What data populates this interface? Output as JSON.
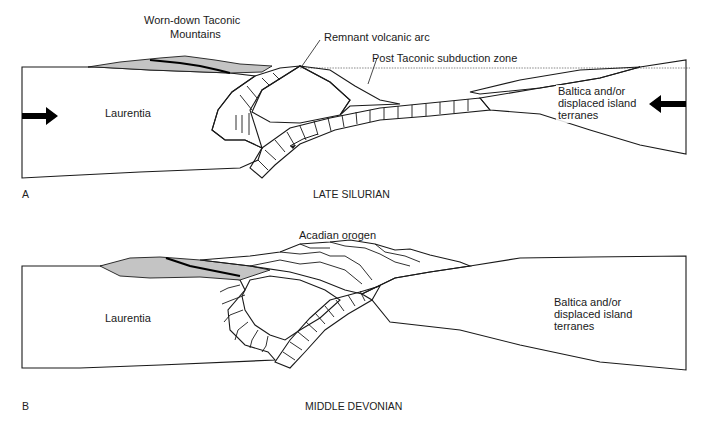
{
  "panels": [
    {
      "letter": "A",
      "caption": "LATE SILURIAN",
      "labels": {
        "mountains_line1": "Worn-down Taconic",
        "mountains_line2": "Mountains",
        "volcanic_arc": "Remnant volcanic arc",
        "subduction_zone": "Post Taconic subduction zone",
        "laurentia": "Laurentia",
        "baltica_line1": "Baltica and/or",
        "baltica_line2": "displaced island",
        "baltica_line3": "terranes"
      },
      "arrows": [
        "convergence-arrow-east",
        "convergence-arrow-west",
        "slab-motion-arrow"
      ]
    },
    {
      "letter": "B",
      "caption": "MIDDLE DEVONIAN",
      "labels": {
        "orogen": "Acadian orogen",
        "laurentia": "Laurentia",
        "baltica_line1": "Baltica and/or",
        "baltica_line2": "displaced island",
        "baltica_line3": "terranes"
      }
    }
  ],
  "colors": {
    "crust_fill": "#ffffff",
    "sediment_gray": "#c4c4c4",
    "arc_fill": "#e6e6e6",
    "ink": "#1a1a1a"
  }
}
